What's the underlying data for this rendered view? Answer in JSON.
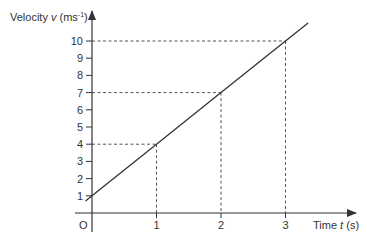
{
  "chart_data": {
    "type": "line",
    "title": "",
    "xlabel": "Time t (s)",
    "ylabel": "Velocity v (ms-1)",
    "xlabel_parts": {
      "pre": "Time ",
      "var": "t",
      "post": " (s)"
    },
    "ylabel_parts": {
      "pre": "Velocity ",
      "var": "v",
      "post": " (ms",
      "sup": "-1",
      "close": ")"
    },
    "origin_label": "O",
    "x_ticks": [
      1,
      2,
      3
    ],
    "y_ticks": [
      1,
      2,
      3,
      4,
      5,
      6,
      7,
      8,
      9,
      10
    ],
    "xlim": [
      0,
      3.9
    ],
    "ylim": [
      0,
      11.5
    ],
    "grid": false,
    "legend": null,
    "series": [
      {
        "name": "velocity",
        "equation": "v = 1 + 3t",
        "x": [
          -0.1,
          0,
          1,
          2,
          3,
          3.35
        ],
        "values": [
          0.7,
          1,
          4,
          7,
          10,
          11.05
        ],
        "color": "#333333"
      }
    ],
    "annotations": [
      {
        "type": "dashed-guide",
        "t": 1,
        "v": 4
      },
      {
        "type": "dashed-guide",
        "t": 2,
        "v": 7
      },
      {
        "type": "dashed-guide",
        "t": 3,
        "v": 10
      }
    ]
  },
  "style": {
    "axis_color": "#333333",
    "line_color": "#333333",
    "guide_color": "#555555"
  }
}
